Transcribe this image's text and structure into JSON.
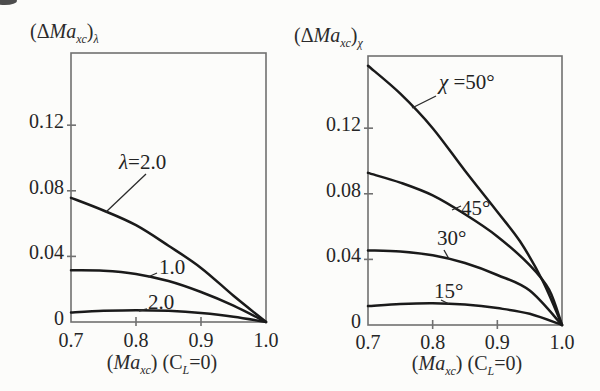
{
  "figure": {
    "background": "#fcfcfa",
    "curve_color": "#1a1a1a",
    "frame_color": "#707070",
    "text_color": "#2b2b2b",
    "leader_color": "#2b2b2b"
  },
  "chart_data": [
    {
      "id": "lambda-chart",
      "type": "line",
      "title": "(ΔMa_xc)_λ",
      "ylabel_marked": "(Δ/{Ma}_{xc})_{λ}",
      "xlabel": "(Ma_xc) (C_L=0)",
      "xlabel_marked": "(/{Ma}_{xc}) (C_{L}=0)",
      "xlim": [
        0.7,
        1.0
      ],
      "ylim": [
        0,
        0.164
      ],
      "grid": false,
      "legend_position": "none",
      "x_ticks": {
        "values": [
          0.7,
          0.8,
          0.9,
          1.0
        ],
        "labels": [
          "0.7",
          "0.8",
          "0.9",
          "1.0"
        ]
      },
      "y_ticks": {
        "values": [
          0,
          0.04,
          0.08,
          0.12
        ],
        "labels": [
          "0",
          "0.04",
          "0.08",
          "0.12"
        ]
      },
      "series": [
        {
          "name": "lambda-2.0",
          "label": "λ=2.0",
          "label_marked": "/{λ}=2.0",
          "points": [
            [
              0.7,
              0.0757
            ],
            [
              0.75,
              0.068
            ],
            [
              0.8,
              0.059
            ],
            [
              0.85,
              0.0465
            ],
            [
              0.9,
              0.033
            ],
            [
              0.95,
              0.016
            ],
            [
              1.0,
              0
            ]
          ]
        },
        {
          "name": "lambda-1.0",
          "label": "1.0",
          "label_marked": "1.0",
          "points": [
            [
              0.7,
              0.0315
            ],
            [
              0.75,
              0.0313
            ],
            [
              0.8,
              0.0293
            ],
            [
              0.85,
              0.025
            ],
            [
              0.9,
              0.0183
            ],
            [
              0.95,
              0.01
            ],
            [
              1.0,
              0
            ]
          ]
        },
        {
          "name": "lambda-2.0-lower",
          "label": "2.0",
          "label_marked": "2.0",
          "points": [
            [
              0.7,
              0.0058
            ],
            [
              0.75,
              0.0068
            ],
            [
              0.8,
              0.0072
            ],
            [
              0.85,
              0.0068
            ],
            [
              0.9,
              0.0055
            ],
            [
              0.95,
              0.0032
            ],
            [
              1.0,
              0
            ]
          ]
        }
      ]
    },
    {
      "id": "chi-chart",
      "type": "line",
      "title": "(ΔMa_xc)_χ",
      "ylabel_marked": "(Δ/{Ma}_{xc})_{χ}",
      "xlabel": "(Ma_xc) (C_L=0)",
      "xlabel_marked": "(/{Ma}_{xc}) (C_{L}=0)",
      "xlim": [
        0.7,
        1.0
      ],
      "ylim": [
        0,
        0.164
      ],
      "grid": false,
      "legend_position": "none",
      "x_ticks": {
        "values": [
          0.7,
          0.8,
          0.9,
          1.0
        ],
        "labels": [
          "0.7",
          "0.8",
          "0.9",
          "1.0"
        ]
      },
      "y_ticks": {
        "values": [
          0,
          0.04,
          0.08,
          0.12
        ],
        "labels": [
          "0",
          "0.04",
          "0.08",
          "0.12"
        ]
      },
      "series": [
        {
          "name": "chi-50",
          "label": "χ =50°",
          "label_marked": "/{χ} =50°",
          "points": [
            [
              0.7,
              0.158
            ],
            [
              0.75,
              0.141
            ],
            [
              0.8,
              0.12
            ],
            [
              0.85,
              0.094
            ],
            [
              0.9,
              0.069
            ],
            [
              0.935,
              0.051
            ],
            [
              0.97,
              0.027
            ],
            [
              1.0,
              0
            ]
          ]
        },
        {
          "name": "chi-45",
          "label": "45°",
          "label_marked": "45°",
          "points": [
            [
              0.7,
              0.0927
            ],
            [
              0.75,
              0.0868
            ],
            [
              0.8,
              0.079
            ],
            [
              0.85,
              0.0675
            ],
            [
              0.9,
              0.054
            ],
            [
              0.95,
              0.0365
            ],
            [
              0.98,
              0.0215
            ],
            [
              1.0,
              0
            ]
          ]
        },
        {
          "name": "chi-30",
          "label": "30°",
          "label_marked": "30°",
          "points": [
            [
              0.7,
              0.0455
            ],
            [
              0.75,
              0.0448
            ],
            [
              0.8,
              0.0425
            ],
            [
              0.85,
              0.0378
            ],
            [
              0.9,
              0.0305
            ],
            [
              0.95,
              0.021
            ],
            [
              1.0,
              0
            ]
          ]
        },
        {
          "name": "chi-15",
          "label": "15°",
          "label_marked": "15°",
          "points": [
            [
              0.7,
              0.0115
            ],
            [
              0.75,
              0.0128
            ],
            [
              0.8,
              0.0133
            ],
            [
              0.85,
              0.0125
            ],
            [
              0.9,
              0.0103
            ],
            [
              0.95,
              0.0068
            ],
            [
              1.0,
              0
            ]
          ]
        }
      ]
    }
  ]
}
